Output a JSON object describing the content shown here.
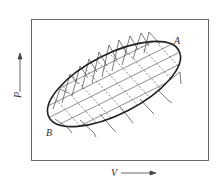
{
  "figure": {
    "type": "pv-diagram",
    "axes": {
      "x_label": "V",
      "y_label": "P",
      "x_arrow": "right",
      "y_arrow": "up"
    },
    "points": [
      {
        "label": "A",
        "position": "upper-right"
      },
      {
        "label": "B",
        "position": "lower-left"
      }
    ],
    "curves": {
      "cycle": "closed ellipse from B to A",
      "adiabats": "solid steep lines with triangular tips outside the cycle",
      "isotherms": "dashed lines"
    },
    "colors": {
      "ink": "#333333",
      "frame": "#666666",
      "background": "#ffffff"
    }
  }
}
